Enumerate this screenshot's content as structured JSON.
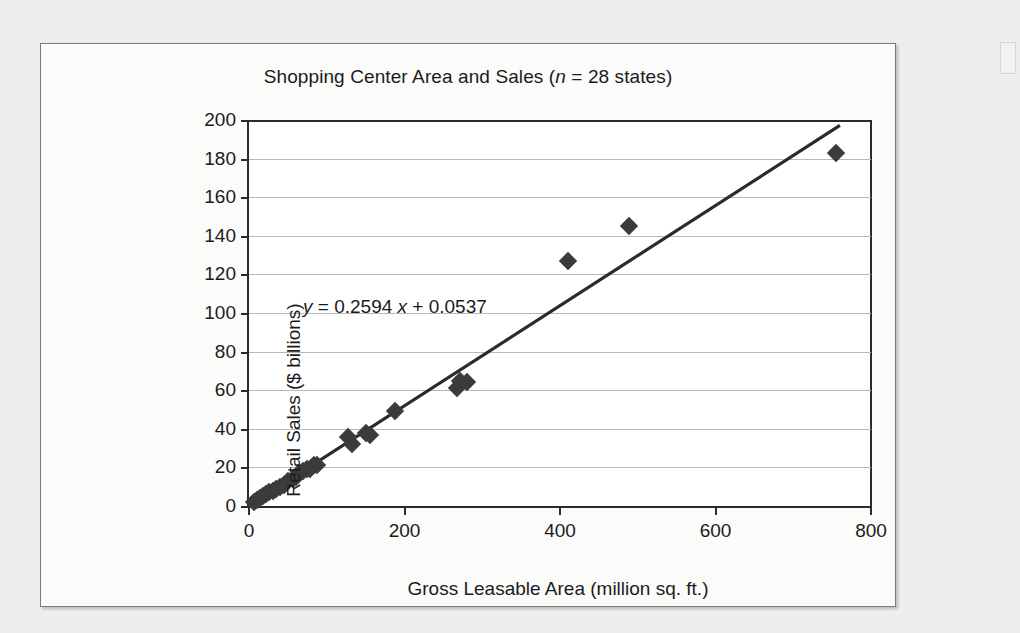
{
  "chart_data": {
    "type": "scatter",
    "title_prefix": "Shopping Center Area and Sales (",
    "title_n_italic": "n",
    "title_suffix": " = 28 states)",
    "title": "Shopping Center Area and Sales (n = 28 states)",
    "xlabel": "Gross Leasable Area (million sq. ft.)",
    "ylabel": "Retail Sales ($ billions)",
    "xlim": [
      0,
      800
    ],
    "ylim": [
      0,
      200
    ],
    "xticks": [
      0,
      200,
      400,
      600,
      800
    ],
    "yticks": [
      0,
      20,
      40,
      60,
      80,
      100,
      120,
      140,
      160,
      180,
      200
    ],
    "grid": "horizontal",
    "legend": "none",
    "n": 28,
    "marker": "diamond",
    "marker_color": "#3b3b3b",
    "annotation": {
      "text": "y = 0.2594 x + 0.0537",
      "y_italic": "y",
      "x_italic": "x",
      "part_a": " = 0.2594 ",
      "part_b": " + 0.0537"
    },
    "fit": {
      "type": "linear",
      "slope": 0.2594,
      "intercept": 0.0537,
      "x_start": 0,
      "x_end": 760
    },
    "points": [
      {
        "x": 6,
        "y": 2
      },
      {
        "x": 10,
        "y": 3
      },
      {
        "x": 14,
        "y": 4
      },
      {
        "x": 18,
        "y": 5
      },
      {
        "x": 22,
        "y": 6
      },
      {
        "x": 26,
        "y": 7
      },
      {
        "x": 31,
        "y": 8
      },
      {
        "x": 35,
        "y": 9
      },
      {
        "x": 40,
        "y": 10
      },
      {
        "x": 45,
        "y": 11
      },
      {
        "x": 50,
        "y": 13
      },
      {
        "x": 56,
        "y": 14
      },
      {
        "x": 61,
        "y": 15
      },
      {
        "x": 64,
        "y": 17
      },
      {
        "x": 70,
        "y": 18
      },
      {
        "x": 74,
        "y": 19
      },
      {
        "x": 78,
        "y": 19
      },
      {
        "x": 84,
        "y": 21
      },
      {
        "x": 88,
        "y": 21
      },
      {
        "x": 127,
        "y": 36
      },
      {
        "x": 133,
        "y": 32
      },
      {
        "x": 150,
        "y": 38
      },
      {
        "x": 156,
        "y": 37
      },
      {
        "x": 188,
        "y": 49
      },
      {
        "x": 268,
        "y": 61
      },
      {
        "x": 272,
        "y": 65
      },
      {
        "x": 281,
        "y": 64
      },
      {
        "x": 410,
        "y": 127
      },
      {
        "x": 489,
        "y": 145
      },
      {
        "x": 755,
        "y": 183
      }
    ]
  }
}
